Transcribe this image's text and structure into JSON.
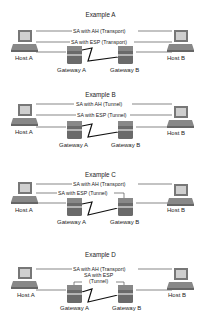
{
  "colors": {
    "line": "#555555",
    "wan": "#111111",
    "router_body": "#6a6a6a",
    "router_dark": "#3c3c3c",
    "monitor": "#777777",
    "screen": "#cfcfcf"
  },
  "examples": [
    {
      "title": "Example A",
      "sa_labels": [
        "SA with AH (Transport)",
        "SA with ESP (Transport)"
      ],
      "host_a": "Host A",
      "host_b": "Host B",
      "gateway_a": "Gateway A",
      "gateway_b": "Gateway B"
    },
    {
      "title": "Example B",
      "sa_labels": [
        "SA with AH (Tunnel)",
        "SA with ESP (Tunnel)"
      ],
      "host_a": "Host A",
      "host_b": "Host B",
      "gateway_a": "Gateway A",
      "gateway_b": "Gateway B"
    },
    {
      "title": "Example C",
      "sa_labels": [
        "SA with AH (Transport)",
        "SA with ESP (Tunnel)"
      ],
      "host_a": "Host A",
      "host_b": "Host B",
      "gateway_a": "Gateway A",
      "gateway_b": "Gateway B"
    },
    {
      "title": "Example D",
      "sa_labels": [
        "SA with AH (Transport)",
        "SA with ESP",
        "(Tunnel)"
      ],
      "host_a": "Host A",
      "host_b": "Host B",
      "gateway_a": "Gateway A",
      "gateway_b": "Gateway B"
    }
  ]
}
